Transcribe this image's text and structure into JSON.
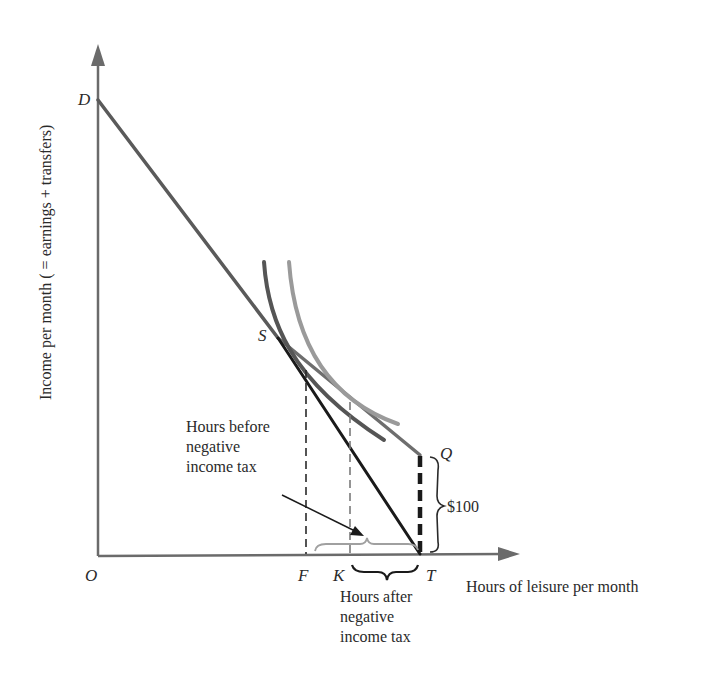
{
  "diagram": {
    "axes": {
      "y_label": "Income per month ( = earnings + transfers)",
      "x_label": "Hours of leisure per month"
    },
    "points": {
      "O": "O",
      "D": "D",
      "S": "S",
      "Q": "Q",
      "T": "T",
      "F": "F",
      "K": "K"
    },
    "annotations": {
      "transfer_amount": "$100",
      "hours_before": "Hours before\nnegative\nincome tax",
      "hours_after": "Hours after\nnegative\nincome tax"
    },
    "colors": {
      "axis": "#6b6b6b",
      "budget_line_original": "#5a5a5a",
      "budget_line_nit": "#1a1a1a",
      "indifference_curve_low": "#555555",
      "indifference_curve_high": "#9a9a9a",
      "bracket_before": "#a0a0a0",
      "text": "#2a2a2a"
    }
  }
}
